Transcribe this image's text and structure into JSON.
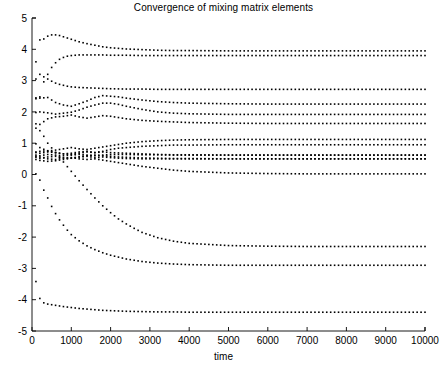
{
  "chart_data": {
    "type": "scatter",
    "title": "Convergence of mixing matrix elements",
    "xlabel": "time",
    "ylabel": "",
    "xlim": [
      0,
      10000
    ],
    "ylim": [
      -5,
      5
    ],
    "xticks": [
      0,
      1000,
      2000,
      3000,
      4000,
      5000,
      6000,
      7000,
      8000,
      9000,
      10000
    ],
    "xticklabels": [
      "0",
      "1000",
      "2000",
      "3000",
      "4000",
      "5000",
      "6000",
      "7000",
      "8000",
      "9000",
      "10000"
    ],
    "yticks": [
      -5,
      -4,
      -3,
      -2,
      -1,
      0,
      1,
      2,
      3,
      4,
      5
    ],
    "yticklabels": [
      "-5",
      "-4",
      "-3",
      "-2",
      "-1",
      "0",
      "1",
      "2",
      "3",
      "4",
      "5"
    ],
    "grid": false,
    "legend": null,
    "marker": "dot",
    "marker_color": "#000000",
    "marker_size": 1.6,
    "sample_interval": 100,
    "series": [
      {
        "name": "a11",
        "x": [
          100,
          200,
          300,
          400,
          500,
          600,
          700,
          800,
          900,
          1000,
          1200,
          1400,
          1600,
          1800,
          2000,
          2400,
          2800,
          3200,
          3600,
          4000,
          5000,
          6000,
          7000,
          8000,
          9000,
          10000
        ],
        "values": [
          3.05,
          4.3,
          4.33,
          4.42,
          4.46,
          4.46,
          4.44,
          4.4,
          4.36,
          4.32,
          4.24,
          4.18,
          4.13,
          4.08,
          4.05,
          4.01,
          3.99,
          3.97,
          3.96,
          3.96,
          3.95,
          3.95,
          3.95,
          3.95,
          3.95,
          3.95
        ],
        "converges_to": 3.95
      },
      {
        "name": "a12",
        "x": [
          100,
          200,
          300,
          400,
          500,
          600,
          700,
          800,
          900,
          1000,
          1200,
          1400,
          1600,
          1800,
          2000,
          2400,
          2800,
          3200,
          4000,
          5000,
          6000,
          7000,
          8000,
          9000,
          10000
        ],
        "values": [
          2.45,
          2.48,
          2.96,
          3.2,
          3.42,
          3.57,
          3.68,
          3.74,
          3.78,
          3.8,
          3.82,
          3.82,
          3.82,
          3.82,
          3.81,
          3.81,
          3.8,
          3.8,
          3.8,
          3.8,
          3.8,
          3.8,
          3.8,
          3.8,
          3.8
        ],
        "converges_to": 3.8
      },
      {
        "name": "a13",
        "x": [
          100,
          200,
          300,
          400,
          500,
          600,
          700,
          800,
          900,
          1000,
          1200,
          1400,
          1600,
          1800,
          2000,
          2400,
          2800,
          3200,
          4000,
          5000,
          6000,
          7000,
          8000,
          9000,
          10000
        ],
        "values": [
          3.6,
          3.2,
          3.12,
          3.05,
          2.98,
          2.92,
          2.88,
          2.85,
          2.82,
          2.8,
          2.78,
          2.77,
          2.76,
          2.75,
          2.74,
          2.73,
          2.73,
          2.72,
          2.72,
          2.72,
          2.72,
          2.72,
          2.72,
          2.72,
          2.72
        ],
        "converges_to": 2.72
      },
      {
        "name": "a14",
        "x": [
          100,
          200,
          400,
          600,
          800,
          1000,
          1200,
          1400,
          1600,
          1800,
          2000,
          2200,
          2400,
          2800,
          3200,
          3600,
          4000,
          5000,
          6000,
          7000,
          8000,
          9000,
          10000
        ],
        "values": [
          2.42,
          2.44,
          2.46,
          2.3,
          2.22,
          2.18,
          2.26,
          2.35,
          2.46,
          2.52,
          2.5,
          2.48,
          2.44,
          2.38,
          2.33,
          2.3,
          2.28,
          2.26,
          2.25,
          2.25,
          2.25,
          2.25,
          2.25
        ],
        "converges_to": 2.25
      },
      {
        "name": "a21",
        "x": [
          100,
          200,
          400,
          600,
          800,
          1000,
          1200,
          1400,
          1600,
          1800,
          2000,
          2200,
          2400,
          2800,
          3200,
          3600,
          4000,
          5000,
          6000,
          7000,
          8000,
          9000,
          10000
        ],
        "values": [
          1.98,
          2.0,
          1.97,
          1.93,
          1.96,
          1.99,
          2.06,
          2.15,
          2.22,
          2.28,
          2.28,
          2.24,
          2.18,
          2.08,
          2.0,
          1.96,
          1.94,
          1.92,
          1.92,
          1.92,
          1.92,
          1.92,
          1.92
        ],
        "converges_to": 1.92
      },
      {
        "name": "a22",
        "x": [
          100,
          200,
          400,
          600,
          800,
          1000,
          1200,
          1400,
          1600,
          1800,
          2000,
          2200,
          2400,
          2800,
          3200,
          3600,
          4000,
          5000,
          6000,
          7000,
          8000,
          9000,
          10000
        ],
        "values": [
          1.62,
          1.6,
          1.78,
          1.84,
          1.86,
          1.9,
          1.84,
          1.8,
          1.84,
          1.88,
          1.86,
          1.82,
          1.78,
          1.73,
          1.7,
          1.68,
          1.66,
          1.64,
          1.63,
          1.63,
          1.63,
          1.63,
          1.63
        ],
        "converges_to": 1.63
      },
      {
        "name": "a23",
        "x": [
          100,
          200,
          400,
          600,
          800,
          1000,
          1200,
          1400,
          1600,
          1800,
          2000,
          2200,
          2400,
          2800,
          3200,
          3600,
          4000,
          5000,
          6000,
          7000,
          8000,
          9000,
          10000
        ],
        "values": [
          0.98,
          0.86,
          0.75,
          0.78,
          0.82,
          0.86,
          0.82,
          0.8,
          0.84,
          0.88,
          0.92,
          0.96,
          1.0,
          1.05,
          1.08,
          1.1,
          1.11,
          1.12,
          1.12,
          1.12,
          1.12,
          1.12,
          1.12
        ],
        "converges_to": 1.12
      },
      {
        "name": "a24",
        "x": [
          100,
          200,
          400,
          600,
          800,
          1000,
          1200,
          1400,
          1600,
          1800,
          2000,
          2200,
          2400,
          2800,
          3200,
          3600,
          4000,
          5000,
          6000,
          7000,
          8000,
          9000,
          10000
        ],
        "values": [
          0.72,
          0.74,
          0.76,
          0.7,
          0.66,
          0.64,
          0.68,
          0.72,
          0.7,
          0.74,
          0.8,
          0.84,
          0.86,
          0.9,
          0.92,
          0.94,
          0.94,
          0.95,
          0.95,
          0.95,
          0.95,
          0.95,
          0.95
        ],
        "converges_to": 0.95
      },
      {
        "name": "a31",
        "x": [
          100,
          200,
          400,
          600,
          800,
          1000,
          1200,
          1400,
          1600,
          1800,
          2000,
          2200,
          2400,
          2800,
          3200,
          3600,
          4000,
          5000,
          6000,
          7000,
          8000,
          9000,
          10000
        ],
        "values": [
          0.62,
          0.6,
          0.64,
          0.62,
          0.6,
          0.62,
          0.64,
          0.62,
          0.6,
          0.62,
          0.64,
          0.64,
          0.64,
          0.63,
          0.63,
          0.62,
          0.62,
          0.62,
          0.62,
          0.62,
          0.62,
          0.62,
          0.62
        ],
        "converges_to": 0.62
      },
      {
        "name": "a32",
        "x": [
          100,
          200,
          400,
          600,
          800,
          1000,
          1200,
          1400,
          1600,
          1800,
          2000,
          2200,
          2400,
          2800,
          3200,
          3600,
          4000,
          5000,
          6000,
          7000,
          8000,
          9000,
          10000
        ],
        "values": [
          0.55,
          0.52,
          0.56,
          0.58,
          0.54,
          0.52,
          0.56,
          0.58,
          0.54,
          0.56,
          0.54,
          0.52,
          0.51,
          0.5,
          0.5,
          0.5,
          0.5,
          0.5,
          0.5,
          0.5,
          0.5,
          0.5,
          0.5
        ],
        "converges_to": 0.5
      },
      {
        "name": "a33",
        "x": [
          100,
          200,
          400,
          600,
          800,
          1000,
          1200,
          1400,
          1600,
          1800,
          2000,
          2200,
          2400,
          2800,
          3200,
          3600,
          4000,
          5000,
          6000,
          7000,
          8000,
          9000,
          10000
        ],
        "values": [
          0.58,
          0.56,
          0.5,
          0.48,
          0.52,
          0.54,
          0.5,
          0.48,
          0.5,
          0.46,
          0.42,
          0.38,
          0.34,
          0.26,
          0.2,
          0.14,
          0.1,
          0.05,
          0.03,
          0.02,
          0.02,
          0.02,
          0.02
        ],
        "converges_to": 0.02
      },
      {
        "name": "a34",
        "x": [
          100,
          200,
          400,
          600,
          800,
          1000,
          1200,
          1400,
          1600,
          1800,
          2000,
          2200,
          2400,
          2800,
          3200,
          3600,
          4000,
          5000,
          6000,
          7000,
          8000,
          9000,
          10000
        ],
        "values": [
          0.48,
          0.45,
          0.42,
          0.44,
          0.48,
          0.52,
          0.56,
          0.6,
          0.62,
          0.6,
          0.58,
          0.56,
          0.55,
          0.53,
          0.52,
          0.51,
          0.51,
          0.5,
          0.5,
          0.5,
          0.5,
          0.5,
          0.5
        ],
        "converges_to": 0.5
      },
      {
        "name": "a41",
        "x": [
          100,
          200,
          300,
          400,
          500,
          600,
          700,
          800,
          900,
          1000,
          1200,
          1400,
          1600,
          1800,
          2000,
          2200,
          2400,
          2600,
          2800,
          3200,
          3600,
          4000,
          5000,
          6000,
          7000,
          8000,
          9000,
          10000
        ],
        "values": [
          1.48,
          1.4,
          1.22,
          1.0,
          0.85,
          0.7,
          0.55,
          0.4,
          0.25,
          0.1,
          -0.2,
          -0.48,
          -0.75,
          -1.0,
          -1.22,
          -1.42,
          -1.58,
          -1.72,
          -1.85,
          -2.02,
          -2.13,
          -2.2,
          -2.27,
          -2.29,
          -2.3,
          -2.3,
          -2.3,
          -2.3
        ],
        "converges_to": -2.3
      },
      {
        "name": "a42",
        "x": [
          100,
          200,
          300,
          400,
          500,
          600,
          700,
          800,
          900,
          1000,
          1200,
          1400,
          1600,
          1800,
          2000,
          2400,
          2800,
          3200,
          3600,
          4000,
          5000,
          6000,
          7000,
          8000,
          9000,
          10000
        ],
        "values": [
          0.02,
          -0.18,
          -0.5,
          -0.75,
          -1.02,
          -1.25,
          -1.45,
          -1.62,
          -1.78,
          -1.92,
          -2.12,
          -2.28,
          -2.4,
          -2.5,
          -2.58,
          -2.7,
          -2.78,
          -2.83,
          -2.86,
          -2.88,
          -2.9,
          -2.9,
          -2.9,
          -2.9,
          -2.9,
          -2.9
        ],
        "converges_to": -2.3
      },
      {
        "name": "a43",
        "x": [
          100,
          200,
          300,
          400,
          600,
          800,
          1000,
          1200,
          1400,
          1600,
          1800,
          2000,
          2400,
          2800,
          3200,
          3600,
          4000,
          5000,
          6000,
          7000,
          8000,
          9000,
          10000
        ],
        "values": [
          -3.42,
          -3.96,
          -4.1,
          -4.14,
          -4.18,
          -4.22,
          -4.25,
          -4.28,
          -4.3,
          -4.32,
          -4.34,
          -4.35,
          -4.37,
          -4.38,
          -4.39,
          -4.39,
          -4.4,
          -4.4,
          -4.4,
          -4.4,
          -4.4,
          -4.4,
          -4.4
        ],
        "converges_to": -4.4
      },
      {
        "name": "a44",
        "x": [
          100,
          200,
          400,
          600,
          800,
          1000,
          1200,
          1400,
          1600,
          1800,
          2000,
          2400,
          2800,
          3200,
          3600,
          4000,
          5000,
          6000,
          7000,
          8000,
          9000,
          10000
        ],
        "values": [
          0.7,
          0.68,
          0.72,
          0.7,
          0.66,
          0.68,
          0.72,
          0.74,
          0.7,
          0.72,
          0.7,
          0.68,
          0.66,
          0.64,
          0.63,
          0.63,
          0.62,
          0.62,
          0.62,
          0.62,
          0.62,
          0.62
        ],
        "converges_to": 0.62
      }
    ]
  },
  "figure": {
    "background_color": "#ffffff",
    "axis_color": "#000000",
    "marker_color": "#000000"
  }
}
